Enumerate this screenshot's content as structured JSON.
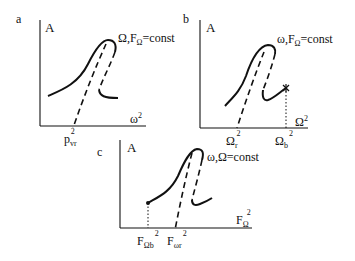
{
  "panels": [
    {
      "id": "a",
      "panel_label": "a",
      "y_axis": "A",
      "x_axis": {
        "base": "ω",
        "sup": "2"
      },
      "condition": {
        "pre": "Ω,F",
        "sub": "Ω",
        "post": "=const"
      },
      "ticks": [
        {
          "base": "p",
          "sub": "vr",
          "sup": "2"
        }
      ]
    },
    {
      "id": "b",
      "panel_label": "b",
      "y_axis": "A",
      "x_axis": {
        "base": "Ω",
        "sup": "2"
      },
      "condition": {
        "pre": "ω,F",
        "sub": "Ω",
        "post": "=const"
      },
      "ticks": [
        {
          "base": "Ω",
          "sub": "r",
          "sup": "2"
        },
        {
          "base": "Ω",
          "sub": "b",
          "sup": "2"
        }
      ]
    },
    {
      "id": "c",
      "panel_label": "c",
      "y_axis": "A",
      "x_axis": {
        "base": "F",
        "sub": "Ω",
        "sup": "2"
      },
      "condition": {
        "pre": "ω,Ω=const",
        "sub": "",
        "post": ""
      },
      "ticks": [
        {
          "base": "F",
          "sub": "Ωb",
          "sup": "2"
        },
        {
          "base": "F",
          "sub": "ωr",
          "sup": "2"
        }
      ]
    }
  ],
  "colors": {
    "ink": "#111111",
    "background": "#ffffff"
  }
}
